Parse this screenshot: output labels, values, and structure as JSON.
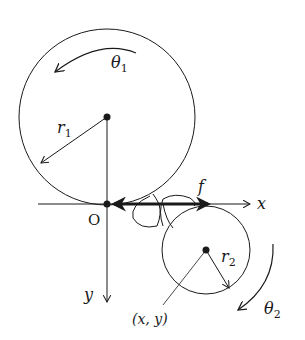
{
  "diagram": {
    "colors": {
      "ink": "#1a1a1a",
      "background": "#ffffff"
    },
    "axes": {
      "origin_label": "O",
      "x_label": "x",
      "y_label": "y"
    },
    "disk1": {
      "radius_label": "r",
      "radius_sub": "1",
      "angle_label": "θ",
      "angle_sub": "1",
      "rotation": "counterclockwise"
    },
    "disk2": {
      "radius_label": "r",
      "radius_sub": "2",
      "angle_label": "θ",
      "angle_sub": "2",
      "rotation": "clockwise",
      "center_label": "(x, y)"
    },
    "force": {
      "label": "f"
    }
  }
}
